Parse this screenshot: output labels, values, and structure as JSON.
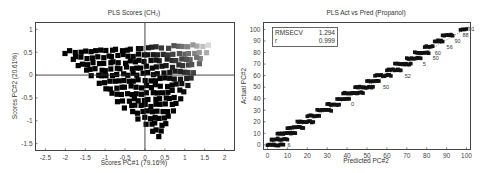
{
  "chart_data": [
    {
      "type": "scatter",
      "title": "PLS Scores (CH₂)",
      "xlabel": "Scores PC#1 (79.16%)",
      "ylabel": "Scores PC#2 (20.61%)",
      "xlim": [
        -2.75,
        2.25
      ],
      "ylim": [
        -1.65,
        1.15
      ],
      "xticks": [
        -2.5,
        -2,
        -1.5,
        -1,
        -0.5,
        0,
        0.5,
        1,
        1.5,
        2
      ],
      "xtick_labels": [
        "-2.5",
        "-2",
        "-1.5",
        "-1",
        "-0.5",
        "0",
        "0.5",
        "1",
        "1.5",
        "2"
      ],
      "yticks": [
        1,
        0.5,
        0,
        -0.5,
        -1,
        -1.5
      ],
      "ytick_labels": [
        "1",
        "0.5",
        "0",
        "-0.5",
        "-1",
        "-1.5"
      ],
      "zero_lines": true,
      "marker": "square",
      "color_gradient": {
        "from": "#000000",
        "to": "#d8d8d8",
        "direction": "increasing PC#1 toward upper right"
      },
      "point_cloud": {
        "description": "triangular lattice of points",
        "vertices": [
          [
            -2.0,
            0.5
          ],
          [
            1.6,
            0.65
          ],
          [
            0.35,
            -1.35
          ]
        ],
        "grid_rows": 14
      }
    },
    {
      "type": "scatter",
      "title": "PLS Act vs Pred (Propanol)",
      "xlabel": "Predicted PC#2",
      "ylabel": "Actual PC#2",
      "xlim": [
        -2,
        102
      ],
      "ylim": [
        -4,
        106
      ],
      "xticks": [
        0,
        10,
        20,
        30,
        40,
        50,
        60,
        70,
        80,
        90,
        100
      ],
      "xtick_labels": [
        "0",
        "10",
        "20",
        "30",
        "40",
        "50",
        "60",
        "70",
        "80",
        "90",
        "100"
      ],
      "yticks": [
        0,
        10,
        20,
        30,
        40,
        50,
        60,
        70,
        80,
        90,
        100
      ],
      "ytick_labels": [
        "0",
        "10",
        "20",
        "30",
        "40",
        "50",
        "60",
        "70",
        "80",
        "90",
        "100"
      ],
      "fit_line": {
        "from": [
          0,
          0
        ],
        "to": [
          100,
          100
        ],
        "style": "dotted"
      },
      "stats": [
        {
          "label": "RMSECV",
          "value": "1.294"
        },
        {
          "label": "r",
          "value": "0.999"
        }
      ],
      "levels": [
        0,
        5,
        10,
        15,
        20,
        25,
        30,
        35,
        40,
        45,
        50,
        55,
        60,
        65,
        70,
        75,
        80,
        85,
        90,
        95,
        100
      ],
      "level_spread": [
        [
          0,
          8
        ],
        [
          2,
          10
        ],
        [
          5,
          14
        ],
        [
          10,
          18
        ],
        [
          15,
          23
        ],
        [
          20,
          26
        ],
        [
          25,
          32
        ],
        [
          30,
          36
        ],
        [
          35,
          41
        ],
        [
          38,
          48
        ],
        [
          44,
          53
        ],
        [
          50,
          56
        ],
        [
          54,
          62
        ],
        [
          60,
          67
        ],
        [
          64,
          72
        ],
        [
          70,
          77
        ],
        [
          74,
          81
        ],
        [
          79,
          83
        ],
        [
          84,
          88
        ],
        [
          88,
          93
        ],
        [
          97,
          100
        ]
      ],
      "point_labels": [
        {
          "text": "6",
          "x": 10,
          "y": 0
        },
        {
          "text": "0",
          "x": 42,
          "y": 35
        },
        {
          "text": "50",
          "x": 58,
          "y": 50
        },
        {
          "text": "52",
          "x": 69,
          "y": 60
        },
        {
          "text": "5",
          "x": 78,
          "y": 70
        },
        {
          "text": "50",
          "x": 83,
          "y": 75
        },
        {
          "text": "60",
          "x": 84,
          "y": 80
        },
        {
          "text": "56",
          "x": 90,
          "y": 85
        },
        {
          "text": "90",
          "x": 94,
          "y": 90
        },
        {
          "text": "88",
          "x": 98,
          "y": 95
        },
        {
          "text": "91",
          "x": 101,
          "y": 100
        }
      ]
    }
  ]
}
